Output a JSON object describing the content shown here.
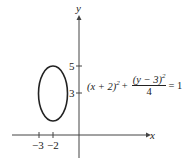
{
  "axes": {
    "x_label": "x",
    "y_label": "y"
  },
  "x_ticks": [
    {
      "value": -3,
      "label": "−3"
    },
    {
      "value": -2,
      "label": "−2"
    }
  ],
  "y_ticks": [
    {
      "value": 5,
      "label": "5"
    },
    {
      "value": 3,
      "label": "3"
    }
  ],
  "equation": {
    "left": "(x + 2)",
    "left_exp": "2",
    "plus": "+",
    "numerator": "(y − 3)",
    "numerator_exp": "2",
    "denominator": "4",
    "rhs": "= 1"
  },
  "ellipse": {
    "center_x": -2,
    "center_y": 3,
    "semi_x": 1,
    "semi_y": 2,
    "stroke": "#222222"
  }
}
